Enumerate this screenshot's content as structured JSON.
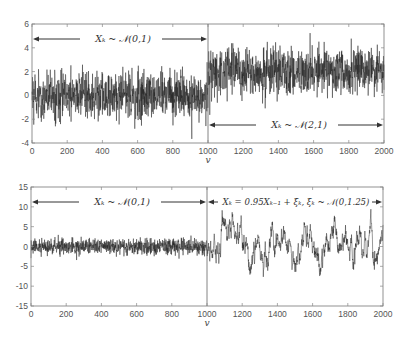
{
  "chart_data": [
    {
      "type": "line",
      "panel": "top",
      "title": "",
      "xlabel": "v",
      "ylabel": "",
      "xlim": [
        0,
        2000
      ],
      "ylim": [
        -4,
        6
      ],
      "xticks": [
        0,
        200,
        400,
        600,
        800,
        1000,
        1200,
        1400,
        1600,
        1800,
        2000
      ],
      "xtick_labels": [
        "0",
        "200",
        "400",
        "600",
        "800",
        "1000",
        "1200",
        "1400",
        "1600",
        "1800",
        "2000"
      ],
      "yticks": [
        -4,
        -2,
        0,
        2,
        4,
        6
      ],
      "ytick_labels": [
        "-4",
        "-2",
        "0",
        "2",
        "4",
        "6"
      ],
      "grid": false,
      "change_point": 1000,
      "segments": [
        {
          "range": [
            0,
            1000
          ],
          "model": "iid",
          "mean": 0,
          "std": 1,
          "label": "X_k ~ N(0,1)",
          "annotation_position": "top"
        },
        {
          "range": [
            1000,
            2000
          ],
          "model": "iid",
          "mean": 2,
          "std": 1,
          "label": "X_k ~ N(2,1)",
          "annotation_position": "bottom"
        }
      ],
      "annotations": [
        {
          "text": "Xₖ ~ 𝒩(0,1)",
          "x_range": [
            0,
            1000
          ],
          "y": 4.8
        },
        {
          "text": "Xₖ ~ 𝒩(2,1)",
          "x_range": [
            1000,
            2000
          ],
          "y": -2.8
        }
      ],
      "seed": 17
    },
    {
      "type": "line",
      "panel": "bottom",
      "title": "",
      "xlabel": "v",
      "ylabel": "",
      "xlim": [
        0,
        2000
      ],
      "ylim": [
        -15,
        15
      ],
      "xticks": [
        0,
        200,
        400,
        600,
        800,
        1000,
        1200,
        1400,
        1600,
        1800,
        2000
      ],
      "xtick_labels": [
        "0",
        "200",
        "400",
        "600",
        "800",
        "1000",
        "1200",
        "1400",
        "1600",
        "1800",
        "2000"
      ],
      "yticks": [
        -15,
        -10,
        -5,
        0,
        5,
        10,
        15
      ],
      "ytick_labels": [
        "-15",
        "-10",
        "-5",
        "0",
        "5",
        "10",
        "15"
      ],
      "grid": false,
      "change_point": 1000,
      "segments": [
        {
          "range": [
            0,
            1000
          ],
          "model": "iid",
          "mean": 0,
          "std": 1,
          "label": "X_k ~ N(0,1)"
        },
        {
          "range": [
            1000,
            2000
          ],
          "model": "ar1",
          "phi": 0.95,
          "noise_std": 1.118,
          "label": "X_k = 0.95 X_{k-1} + ξ_k, ξ_k ~ N(0,1.25)"
        }
      ],
      "annotations": [
        {
          "text": "Xₖ ~ 𝒩(0,1)",
          "x_range": [
            0,
            1000
          ],
          "y": 11.5
        },
        {
          "text": "Xₖ = 0.95Xₖ₋₁ + ξₖ,  ξₖ ~ 𝒩(0,1.25)",
          "x_range": [
            1000,
            2000
          ],
          "y": 11.5
        }
      ],
      "seed": 91
    }
  ],
  "panels": {
    "top": {
      "xlabel": "v",
      "annot_left": "Xₖ ~ 𝒩(0,1)",
      "annot_right": "Xₖ ~ 𝒩(2,1)"
    },
    "bottom": {
      "xlabel": "v",
      "annot_left": "Xₖ ~ 𝒩(0,1)",
      "annot_right": "Xₖ = 0.95Xₖ₋₁ + ξₖ,  ξₖ ~ 𝒩(0,1.25)"
    }
  }
}
